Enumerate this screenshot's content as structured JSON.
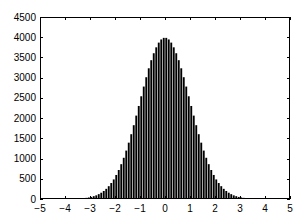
{
  "chart_data": {
    "type": "bar",
    "title": "",
    "xlabel": "",
    "ylabel": "",
    "xlim": [
      -5,
      5
    ],
    "ylim": [
      0,
      4500
    ],
    "grid": false,
    "legend": null,
    "bar_color": "#000000",
    "background": "#ffffff",
    "xticks": [
      -5,
      -4,
      -3,
      -2,
      -1,
      0,
      1,
      2,
      3,
      4,
      5
    ],
    "xtick_labels": [
      "−5",
      "−4",
      "−3",
      "−2",
      "−1",
      "0",
      "1",
      "2",
      "3",
      "4",
      "5"
    ],
    "yticks": [
      0,
      500,
      1000,
      1500,
      2000,
      2500,
      3000,
      3500,
      4000,
      4500
    ],
    "ytick_labels": [
      "0",
      "500",
      "1000",
      "1500",
      "2000",
      "2500",
      "3000",
      "3500",
      "4000",
      "4500"
    ],
    "bin_width": 0.1,
    "x": [
      -3.95,
      -3.85,
      -3.75,
      -3.65,
      -3.55,
      -3.45,
      -3.35,
      -3.25,
      -3.15,
      -3.05,
      -2.95,
      -2.85,
      -2.75,
      -2.65,
      -2.55,
      -2.45,
      -2.35,
      -2.25,
      -2.15,
      -2.05,
      -1.95,
      -1.85,
      -1.75,
      -1.65,
      -1.55,
      -1.45,
      -1.35,
      -1.25,
      -1.15,
      -1.05,
      -0.95,
      -0.85,
      -0.75,
      -0.65,
      -0.55,
      -0.45,
      -0.35,
      -0.25,
      -0.15,
      -0.05,
      0.05,
      0.15,
      0.25,
      0.35,
      0.45,
      0.55,
      0.65,
      0.75,
      0.85,
      0.95,
      1.05,
      1.15,
      1.25,
      1.35,
      1.45,
      1.55,
      1.65,
      1.75,
      1.85,
      1.95,
      2.05,
      2.15,
      2.25,
      2.35,
      2.45,
      2.55,
      2.65,
      2.75,
      2.85,
      2.95,
      3.05,
      3.15,
      3.25,
      3.35,
      3.45,
      3.55,
      3.65,
      3.75,
      3.85,
      3.95
    ],
    "values": [
      1,
      1,
      3,
      4,
      7,
      10,
      14,
      21,
      28,
      38,
      51,
      70,
      90,
      120,
      155,
      198,
      251,
      317,
      395,
      484,
      594,
      717,
      861,
      1019,
      1197,
      1393,
      1602,
      1825,
      2062,
      2300,
      2540,
      2780,
      3011,
      3232,
      3432,
      3604,
      3750,
      3867,
      3945,
      3984,
      3984,
      3945,
      3867,
      3750,
      3604,
      3432,
      3232,
      3011,
      2780,
      2540,
      2300,
      2062,
      1825,
      1602,
      1393,
      1197,
      1019,
      861,
      717,
      594,
      484,
      395,
      317,
      251,
      198,
      155,
      120,
      90,
      70,
      51,
      38,
      28,
      21,
      14,
      10,
      7,
      4,
      3,
      1,
      1
    ]
  }
}
